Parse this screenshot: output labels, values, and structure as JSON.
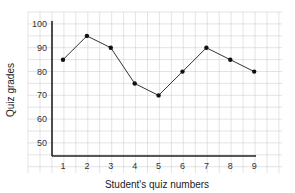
{
  "chart_data": {
    "type": "line",
    "title": "",
    "xlabel": "Student's quiz numbers",
    "ylabel": "Quiz grades",
    "x": [
      1,
      2,
      3,
      4,
      5,
      6,
      7,
      8,
      9
    ],
    "categories": [
      "1",
      "2",
      "3",
      "4",
      "5",
      "6",
      "7",
      "8",
      "9"
    ],
    "series": [
      {
        "name": "Quiz grades",
        "values": [
          85,
          95,
          90,
          75,
          70,
          80,
          90,
          85,
          80
        ]
      }
    ],
    "yticks": [
      "50",
      "60",
      "70",
      "80",
      "90",
      "100"
    ],
    "ylim": [
      45,
      100
    ],
    "grid": true,
    "legend": null,
    "colors": {
      "line": "#333333",
      "marker": "#111111",
      "grid": "#d0d0d0",
      "axis": "#222222"
    }
  }
}
